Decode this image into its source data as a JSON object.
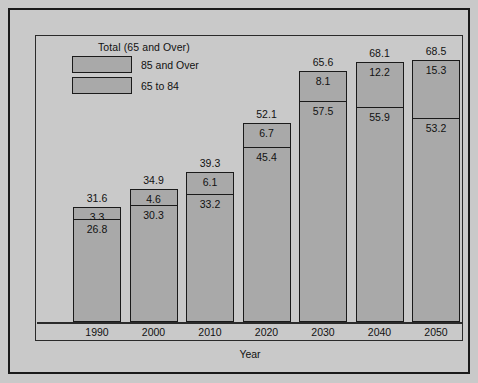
{
  "legend": {
    "title": "Total (65 and Over)",
    "items": [
      {
        "label": "85 and Over",
        "swatch": "#a9a9a9"
      },
      {
        "label": "65 to 84",
        "swatch": "#a9a9a9"
      }
    ]
  },
  "colors": {
    "figure_background": "#c9c9c9",
    "bar_fill": "#a9a9a9",
    "outline": "#1a1a1a",
    "text": "#111111"
  },
  "chart_data": {
    "type": "bar",
    "stacked": true,
    "title": "",
    "xlabel": "Year",
    "ylabel": "",
    "grid": false,
    "legend_position": "top-left",
    "ylim": [
      0,
      68.5
    ],
    "categories": [
      "1990",
      "2000",
      "2010",
      "2020",
      "2030",
      "2040",
      "2050"
    ],
    "series": [
      {
        "name": "65 to 84",
        "values": [
          26.8,
          30.3,
          33.2,
          45.4,
          57.5,
          55.9,
          53.2
        ]
      },
      {
        "name": "85 and Over",
        "values": [
          3.3,
          4.6,
          6.1,
          6.7,
          8.1,
          12.2,
          15.3
        ]
      }
    ],
    "totals": {
      "name": "Total (65 and Over)",
      "values": [
        31.6,
        34.9,
        39.3,
        52.1,
        65.6,
        68.1,
        68.5
      ]
    }
  }
}
